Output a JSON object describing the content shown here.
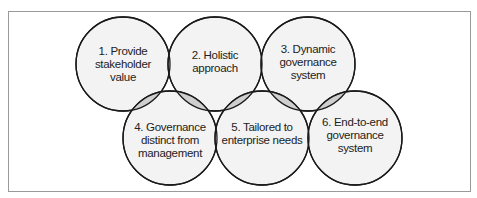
{
  "diagram": {
    "type": "overlapping-circles",
    "frame": {
      "border_color": "#9a9a9a",
      "background": "#ffffff"
    },
    "colors": {
      "circle_fill": "#f3f3f3",
      "circle_stroke": "#1a1a1a",
      "intersection_fill": "#cfcfcf",
      "text": "#222222"
    },
    "circles": [
      {
        "id": 1,
        "lines": [
          "1. Provide",
          "stakeholder",
          "value"
        ],
        "cx": 123,
        "cy": 64,
        "r": 47
      },
      {
        "id": 2,
        "lines": [
          "2. Holistic",
          "approach"
        ],
        "cx": 215,
        "cy": 64,
        "r": 47
      },
      {
        "id": 3,
        "lines": [
          "3. Dynamic",
          "governance",
          "system"
        ],
        "cx": 308,
        "cy": 64,
        "r": 47
      },
      {
        "id": 4,
        "lines": [
          "4. Governance",
          "distinct from",
          "management"
        ],
        "cx": 170,
        "cy": 138,
        "r": 47
      },
      {
        "id": 5,
        "lines": [
          "5. Tailored to",
          "enterprise needs"
        ],
        "cx": 262,
        "cy": 138,
        "r": 47
      },
      {
        "id": 6,
        "lines": [
          "6. End-to-end",
          "governance",
          "system"
        ],
        "cx": 355,
        "cy": 138,
        "r": 47
      }
    ]
  }
}
